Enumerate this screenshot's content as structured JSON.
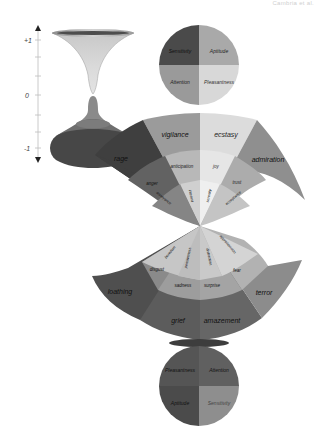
{
  "header": {
    "text": "Cambria et al."
  },
  "axis": {
    "top_label": "+1",
    "mid_label": "0",
    "bottom_label": "-1"
  },
  "top_circle": {
    "quadrants": [
      {
        "label": "Sensitivity",
        "color": "#4a4a4a"
      },
      {
        "label": "Aptitude",
        "color": "#a9a9a9"
      },
      {
        "label": "Attention",
        "color": "#9a9a9a"
      },
      {
        "label": "Pleasantness",
        "color": "#d8d8d8"
      }
    ]
  },
  "upper_fan": {
    "outer": [
      {
        "label": "rage",
        "color": "#3f3f3f"
      },
      {
        "label": "vigilance",
        "color": "#9b9b9b"
      },
      {
        "label": "ecstasy",
        "color": "#dcdcdc"
      },
      {
        "label": "admiration",
        "color": "#8f8f8f"
      }
    ],
    "middle": [
      {
        "label": "anger",
        "color": "#626262"
      },
      {
        "label": "anticipation",
        "color": "#b8b8b8"
      },
      {
        "label": "joy",
        "color": "#e6e6e6"
      },
      {
        "label": "trust",
        "color": "#acacac"
      }
    ],
    "inner": [
      {
        "label": "annoyance",
        "color": "#858585"
      },
      {
        "label": "interest",
        "color": "#d0d0d0"
      },
      {
        "label": "serenity",
        "color": "#efefef"
      },
      {
        "label": "acceptance",
        "color": "#c4c4c4"
      }
    ]
  },
  "lower_fan": {
    "inner": [
      {
        "label": "boredom",
        "color": "#c6c6c6"
      },
      {
        "label": "pensiveness",
        "color": "#bdbdbd"
      },
      {
        "label": "distraction",
        "color": "#c9c9c9"
      },
      {
        "label": "apprehension",
        "color": "#d4d4d4"
      }
    ],
    "middle": [
      {
        "label": "disgust",
        "color": "#8a8a8a"
      },
      {
        "label": "sadness",
        "color": "#9d9d9d"
      },
      {
        "label": "surprise",
        "color": "#a4a4a4"
      },
      {
        "label": "fear",
        "color": "#b2b2b2"
      }
    ],
    "outer": [
      {
        "label": "loathing",
        "color": "#4f4f4f"
      },
      {
        "label": "grief",
        "color": "#5c5c5c"
      },
      {
        "label": "amazement",
        "color": "#666666"
      },
      {
        "label": "terror",
        "color": "#8c8c8c"
      }
    ]
  },
  "bottom_circle": {
    "quadrants": [
      {
        "label": "Pleasantness",
        "color": "#555555"
      },
      {
        "label": "Attention",
        "color": "#606060"
      },
      {
        "label": "Aptitude",
        "color": "#4b4b4b"
      },
      {
        "label": "Sensitivity",
        "color": "#8e8e8e"
      }
    ]
  }
}
